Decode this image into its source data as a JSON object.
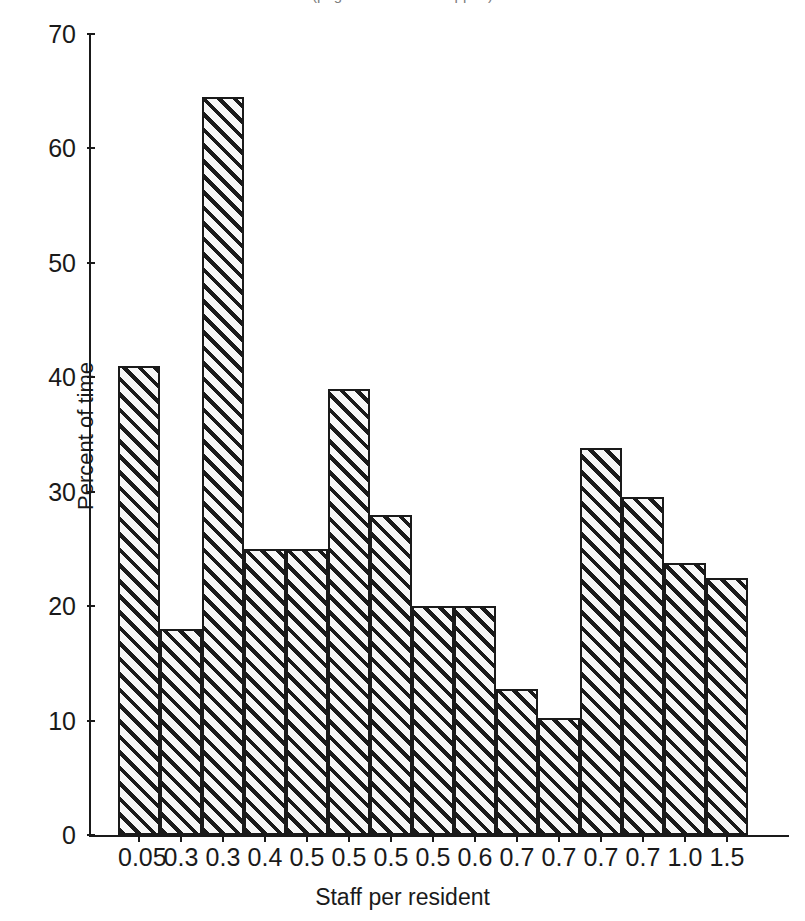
{
  "figure": {
    "cropped_title": "(page header text cropped)"
  },
  "axis_title_x": "Staff per resident",
  "axis_title_y": "Percent of time",
  "chart_data": {
    "type": "bar",
    "title": "",
    "xlabel": "Staff per resident",
    "ylabel": "Percent of time",
    "ylim": [
      0,
      70
    ],
    "yticks": [
      0,
      10,
      20,
      30,
      40,
      50,
      60,
      70
    ],
    "grid": false,
    "legend": null,
    "categories": [
      "0.05",
      "0.3",
      "0.3",
      "0.4",
      "0.5",
      "0.5",
      "0.5",
      "0.5",
      "0.6",
      "0.7",
      "0.7",
      "0.7",
      "0.7",
      "1.0",
      "1.5"
    ],
    "values": [
      41,
      18,
      64.5,
      25,
      25,
      39,
      28,
      20,
      20,
      12.8,
      10.2,
      33.8,
      29.5,
      23.8,
      22.5
    ]
  }
}
